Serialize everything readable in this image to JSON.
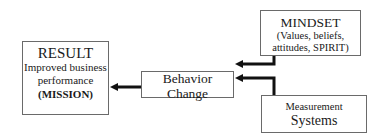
{
  "diagram": {
    "result": {
      "title": "RESULT",
      "line1": "Improved business",
      "line2": "performance",
      "line3": "(MISSION)"
    },
    "behavior": {
      "line1": "Behavior",
      "line2": "Change"
    },
    "mindset": {
      "title": "MINDSET",
      "line1": "(Values, beliefs,",
      "line2": "attitudes, SPIRIT)"
    },
    "measurement": {
      "line1": "Measurement",
      "line2": "Systems"
    },
    "edges": [
      {
        "from": "mindset",
        "to": "behavior"
      },
      {
        "from": "measurement",
        "to": "behavior"
      },
      {
        "from": "behavior",
        "to": "result"
      }
    ],
    "colors": {
      "border": "#6a6a6a",
      "arrow": "#111111",
      "text": "#1a1a1a"
    }
  }
}
